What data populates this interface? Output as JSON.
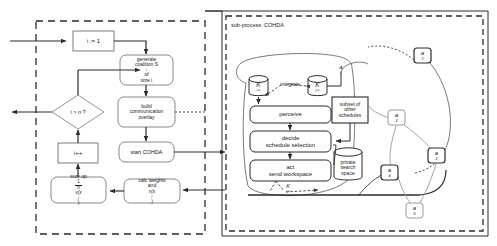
{
  "diagram": {
    "type": "flowchart",
    "title_label": "sub-process: COHDA",
    "main_process": {
      "container_style": "dashed-border",
      "nodes": [
        {
          "id": "init",
          "label": "i := 1",
          "shape": "rectangle"
        },
        {
          "id": "generate",
          "label_line1": "generate",
          "label_line2": "coalition S",
          "label_line2_sup": "i",
          "label_line2_tail": " of",
          "label_line3": "size i",
          "shape": "rounded-rectangle"
        },
        {
          "id": "overlay",
          "label_line1": "build",
          "label_line2": "communication",
          "label_line3": "overlay",
          "shape": "rounded-rectangle"
        },
        {
          "id": "start",
          "label": "start COHDA",
          "shape": "rounded-rectangle"
        },
        {
          "id": "calc",
          "label_line1": "calc weights",
          "label_line2_pre": "and ",
          "label_line2_fn": "v(x",
          "label_line2_sup": "j",
          "label_line2_post": ")",
          "shape": "rounded-rectangle"
        },
        {
          "id": "sumup",
          "label_line1": "sum up",
          "label_frac_num": "1",
          "label_frac_den": "n",
          "label_line2_fn": "v(x",
          "label_line2_sup": "j",
          "label_line2_post": ")",
          "shape": "rounded-rectangle"
        },
        {
          "id": "increment",
          "label": "i++",
          "shape": "rectangle"
        },
        {
          "id": "decision",
          "label": "i > n ?",
          "shape": "diamond"
        }
      ]
    },
    "subprocess": {
      "label": "sub-process: COHDA",
      "container_style": "dashed-border",
      "nodes": [
        {
          "id": "knowledge-in",
          "label": "K",
          "sub": "i,c",
          "shape": "cylinder"
        },
        {
          "id": "knowledge-out",
          "label": "K",
          "sub": "j,c",
          "shape": "cylinder"
        },
        {
          "id": "integrate",
          "label": "integrate",
          "shape": "text-label"
        },
        {
          "id": "agent-j",
          "label": "a",
          "sub": "j",
          "shape": "text-label"
        },
        {
          "id": "perceive",
          "label": "perceive",
          "shape": "rounded-rectangle"
        },
        {
          "id": "decide",
          "label_line1": "decide",
          "label_line2": "schedule selection",
          "shape": "rounded-rectangle"
        },
        {
          "id": "act",
          "label_line1": "act",
          "label_line2": "send workspace",
          "shape": "rounded-rectangle"
        },
        {
          "id": "subset",
          "label_line1": "subset of",
          "label_line2": "other",
          "label_line3": "schedules",
          "shape": "rectangle"
        },
        {
          "id": "private-space",
          "label_line1": "private",
          "label_line2": "search",
          "label_line3": "space",
          "shape": "cylinder"
        },
        {
          "id": "knowledge-emit",
          "label": "K",
          "sub": "i,c",
          "shape": "text-label"
        }
      ],
      "agent_network": {
        "agents": [
          {
            "id": "a1",
            "label": "a",
            "sub": "1"
          },
          {
            "id": "a2",
            "label": "a",
            "sub": "2"
          },
          {
            "id": "a3",
            "label": "a",
            "sub": "3"
          },
          {
            "id": "a4",
            "label": "a",
            "sub": "4"
          },
          {
            "id": "a5",
            "label": "a",
            "sub": "5"
          }
        ]
      }
    },
    "colors": {
      "stroke": "#2b2b2b",
      "light_stroke": "#9a9a9a",
      "background": "#ffffff",
      "text": "#1a1a1a"
    }
  }
}
